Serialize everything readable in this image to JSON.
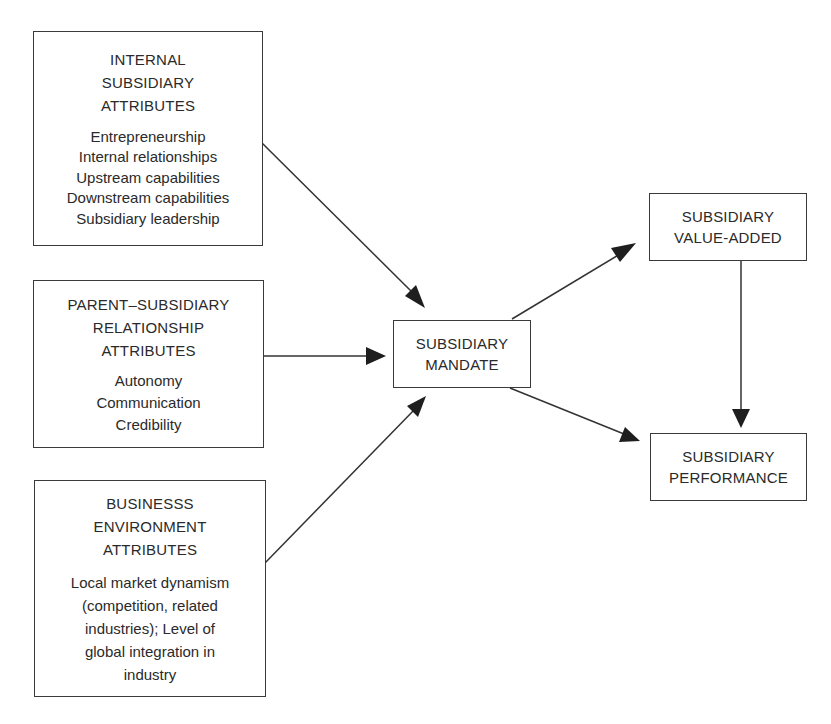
{
  "diagram": {
    "nodes": {
      "internal": {
        "title_lines": [
          "INTERNAL",
          "SUBSIDIARY",
          "ATTRIBUTES"
        ],
        "items": [
          "Entrepreneurship",
          "Internal relationships",
          "Upstream capabilities",
          "Downstream capabilities",
          "Subsidiary leadership"
        ]
      },
      "parent": {
        "title_lines": [
          "PARENT–SUBSIDIARY",
          "RELATIONSHIP",
          "ATTRIBUTES"
        ],
        "items": [
          "Autonomy",
          "Communication",
          "Credibility"
        ]
      },
      "business": {
        "title_lines": [
          "BUSINESSS",
          "ENVIRONMENT",
          "ATTRIBUTES"
        ],
        "description_lines": [
          "Local market dynamism",
          "(competition, related",
          "industries); Level of",
          "global integration in",
          "industry"
        ]
      },
      "mandate": {
        "title_lines": [
          "SUBSIDIARY",
          "MANDATE"
        ]
      },
      "value_added": {
        "title_lines": [
          "SUBSIDIARY",
          "VALUE-ADDED"
        ]
      },
      "performance": {
        "title_lines": [
          "SUBSIDIARY",
          "PERFORMANCE"
        ]
      }
    },
    "edges": [
      {
        "from": "internal",
        "to": "mandate"
      },
      {
        "from": "parent",
        "to": "mandate"
      },
      {
        "from": "business",
        "to": "mandate"
      },
      {
        "from": "mandate",
        "to": "value_added"
      },
      {
        "from": "mandate",
        "to": "performance"
      },
      {
        "from": "value_added",
        "to": "performance"
      }
    ]
  }
}
